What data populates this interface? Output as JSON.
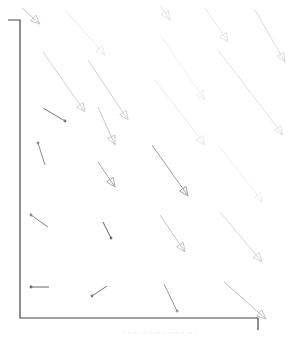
{
  "figure": {
    "type": "vector-field",
    "caption": "· · ··· ·· · ····· ···· ·· ·· ·",
    "frame": {
      "color": "#333333"
    },
    "arrows": [
      {
        "x1": 22,
        "y1": 8,
        "x2": 40,
        "y2": 24,
        "color": "#c8c8c8",
        "head": "open"
      },
      {
        "x1": 65,
        "y1": 10,
        "x2": 105,
        "y2": 55,
        "color": "#ececec",
        "head": "open"
      },
      {
        "x1": 160,
        "y1": 5,
        "x2": 170,
        "y2": 20,
        "color": "#e4e4e4",
        "head": "open"
      },
      {
        "x1": 205,
        "y1": 8,
        "x2": 228,
        "y2": 42,
        "color": "#e6e6e6",
        "head": "open"
      },
      {
        "x1": 255,
        "y1": 10,
        "x2": 285,
        "y2": 62,
        "color": "#dcdcdc",
        "head": "open"
      },
      {
        "x1": 43,
        "y1": 52,
        "x2": 85,
        "y2": 112,
        "color": "#d4d4d4",
        "head": "open"
      },
      {
        "x1": 88,
        "y1": 60,
        "x2": 128,
        "y2": 120,
        "color": "#d2d2d2",
        "head": "open"
      },
      {
        "x1": 160,
        "y1": 35,
        "x2": 205,
        "y2": 100,
        "color": "#f0f0f0",
        "head": "open"
      },
      {
        "x1": 218,
        "y1": 50,
        "x2": 283,
        "y2": 135,
        "color": "#e2e2e2",
        "head": "open"
      },
      {
        "x1": 43,
        "y1": 108,
        "x2": 65,
        "y2": 121,
        "color": "#777777",
        "head": "dot"
      },
      {
        "x1": 98,
        "y1": 107,
        "x2": 115,
        "y2": 145,
        "color": "#c8c8c8",
        "head": "open"
      },
      {
        "x1": 155,
        "y1": 80,
        "x2": 205,
        "y2": 145,
        "color": "#ebebeb",
        "head": "open"
      },
      {
        "x1": 45,
        "y1": 165,
        "x2": 38,
        "y2": 143,
        "color": "#8a8a8a",
        "head": "dot"
      },
      {
        "x1": 98,
        "y1": 162,
        "x2": 115,
        "y2": 187,
        "color": "#aaaaaa",
        "head": "open"
      },
      {
        "x1": 152,
        "y1": 145,
        "x2": 188,
        "y2": 196,
        "color": "#a0a0a0",
        "head": "open"
      },
      {
        "x1": 218,
        "y1": 145,
        "x2": 263,
        "y2": 202,
        "color": "#efefef",
        "head": "open"
      },
      {
        "x1": 48,
        "y1": 227,
        "x2": 31,
        "y2": 215,
        "color": "#888888",
        "head": "dot"
      },
      {
        "x1": 103,
        "y1": 222,
        "x2": 111,
        "y2": 238,
        "color": "#666666",
        "head": "dot"
      },
      {
        "x1": 160,
        "y1": 215,
        "x2": 185,
        "y2": 252,
        "color": "#c6c6c6",
        "head": "open"
      },
      {
        "x1": 220,
        "y1": 212,
        "x2": 262,
        "y2": 262,
        "color": "#d8d8d8",
        "head": "open"
      },
      {
        "x1": 49,
        "y1": 287,
        "x2": 31,
        "y2": 287,
        "color": "#666666",
        "head": "dot"
      },
      {
        "x1": 107,
        "y1": 286,
        "x2": 92,
        "y2": 296,
        "color": "#777777",
        "head": "dot"
      },
      {
        "x1": 164,
        "y1": 284,
        "x2": 177,
        "y2": 311,
        "color": "#999999",
        "head": "dot"
      },
      {
        "x1": 224,
        "y1": 282,
        "x2": 266,
        "y2": 319,
        "color": "#c2c2c2",
        "head": "open"
      }
    ]
  }
}
